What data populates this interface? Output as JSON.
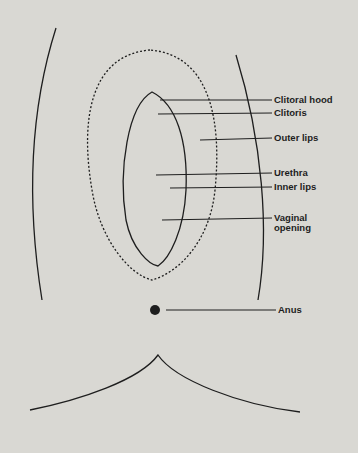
{
  "diagram": {
    "type": "anatomical-line-drawing",
    "colors": {
      "background": "#d9d8d3",
      "ink": "#1e1e1e"
    },
    "labels": [
      {
        "id": "clitoral-hood",
        "text": "Clitoral hood"
      },
      {
        "id": "clitoris",
        "text": "Clitoris"
      },
      {
        "id": "outer-lips",
        "text": "Outer lips"
      },
      {
        "id": "urethra",
        "text": "Urethra"
      },
      {
        "id": "inner-lips",
        "text": "Inner lips"
      },
      {
        "id": "vaginal-opening-1",
        "text": "Vaginal"
      },
      {
        "id": "vaginal-opening-2",
        "text": "opening"
      },
      {
        "id": "anus",
        "text": "Anus"
      }
    ]
  }
}
